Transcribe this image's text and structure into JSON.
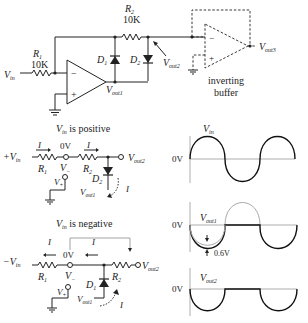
{
  "main_circuit": {
    "r1": {
      "name": "R",
      "sub": "1",
      "value": "10K"
    },
    "r2": {
      "name": "R",
      "sub": "2",
      "value": "10K"
    },
    "d1": {
      "name": "D",
      "sub": "1"
    },
    "d2": {
      "name": "D",
      "sub": "2"
    },
    "vin": {
      "name": "V",
      "sub": "in"
    },
    "vout1": {
      "name": "V",
      "sub": "out1"
    },
    "vout2": {
      "name": "V",
      "sub": "out2"
    },
    "vout3": {
      "name": "V",
      "sub": "out3"
    },
    "opamp_minus": "−",
    "opamp_plus": "+",
    "buffer_label_line1": "inverting",
    "buffer_label_line2": "buffer"
  },
  "positive_case": {
    "title_v": "V",
    "title_sub": "in",
    "title_rest": " is positive",
    "input_label": "+V",
    "input_sub": "in",
    "current": "I",
    "node_voltage": "0V",
    "r1": {
      "name": "R",
      "sub": "1"
    },
    "r2": {
      "name": "R",
      "sub": "2"
    },
    "d2": {
      "name": "D",
      "sub": "2"
    },
    "vminus": {
      "name": "V",
      "sub": "−"
    },
    "vplus": {
      "name": "V",
      "sub": "+"
    },
    "vout1": {
      "name": "V",
      "sub": "out1"
    },
    "vout2": {
      "name": "V",
      "sub": "out2"
    }
  },
  "negative_case": {
    "title_v": "V",
    "title_sub": "in",
    "title_rest": " is negative",
    "input_label": "−V",
    "input_sub": "in",
    "current": "I",
    "node_voltage": "0V",
    "r1": {
      "name": "R",
      "sub": "1"
    },
    "r2": {
      "name": "R",
      "sub": "2"
    },
    "d1": {
      "name": "D",
      "sub": "1"
    },
    "vminus": {
      "name": "V",
      "sub": "−"
    },
    "vplus": {
      "name": "V",
      "sub": "+"
    },
    "vout1": {
      "name": "V",
      "sub": "out1"
    },
    "vout2": {
      "name": "V",
      "sub": "out2"
    }
  },
  "waveforms": {
    "zero_label": "0V",
    "vin": {
      "name": "V",
      "sub": "in"
    },
    "vout1": {
      "name": "V",
      "sub": "out1",
      "drop_label": "0.6V"
    },
    "vout2": {
      "name": "V",
      "sub": "out2"
    }
  }
}
